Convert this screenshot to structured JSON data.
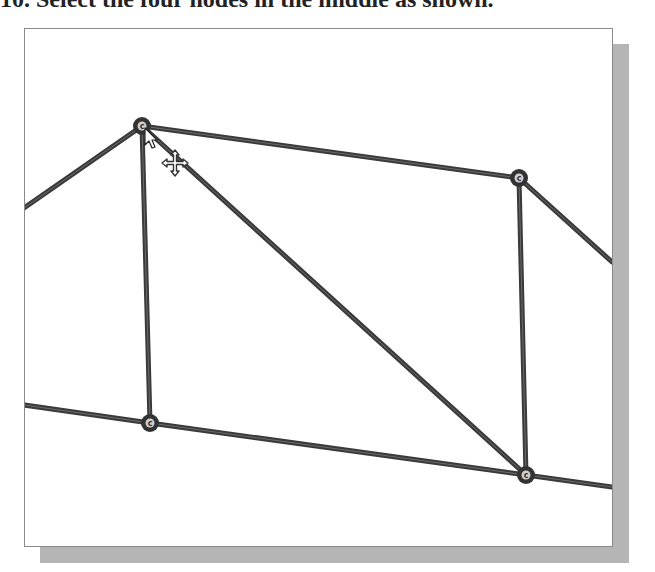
{
  "instruction": {
    "step_text": "10. Select the four nodes in the middle as shown."
  },
  "viewport": {
    "name": "truss-graphics-window",
    "frame_color": "#8a8a8a",
    "shadow_color": "#b5b5b5",
    "background": "#ffffff"
  },
  "truss": {
    "member_color": "#3a3a3a",
    "member_highlight": "#8c8c8c",
    "node_ring_color": "#333333",
    "node_fill_color": "#cfcfcf",
    "node_glyph": "c",
    "nodes": [
      {
        "id": "node-top-left",
        "x": 142,
        "y": 126,
        "selected": true
      },
      {
        "id": "node-top-right",
        "x": 519,
        "y": 178,
        "selected": true
      },
      {
        "id": "node-bottom-left",
        "x": 150,
        "y": 423,
        "selected": true
      },
      {
        "id": "node-bottom-right",
        "x": 526,
        "y": 475,
        "selected": true
      }
    ],
    "members": [
      {
        "id": "member-left-diagonal",
        "x1": 24,
        "y1": 208,
        "x2": 142,
        "y2": 126
      },
      {
        "id": "member-top-chord",
        "x1": 142,
        "y1": 126,
        "x2": 519,
        "y2": 178
      },
      {
        "id": "member-right-diagonal",
        "x1": 519,
        "y1": 178,
        "x2": 612,
        "y2": 262
      },
      {
        "id": "member-left-vertical",
        "x1": 142,
        "y1": 126,
        "x2": 150,
        "y2": 423
      },
      {
        "id": "member-right-vertical",
        "x1": 519,
        "y1": 178,
        "x2": 526,
        "y2": 475
      },
      {
        "id": "member-middle-diagonal",
        "x1": 142,
        "y1": 126,
        "x2": 526,
        "y2": 475
      },
      {
        "id": "member-bottom-chord-left",
        "x1": 24,
        "y1": 405,
        "x2": 150,
        "y2": 423
      },
      {
        "id": "member-bottom-chord-middle",
        "x1": 150,
        "y1": 423,
        "x2": 526,
        "y2": 475
      },
      {
        "id": "member-bottom-chord-right",
        "x1": 526,
        "y1": 475,
        "x2": 612,
        "y2": 487
      }
    ]
  },
  "cursor": {
    "type": "arrow-with-move",
    "x": 145,
    "y": 128
  }
}
